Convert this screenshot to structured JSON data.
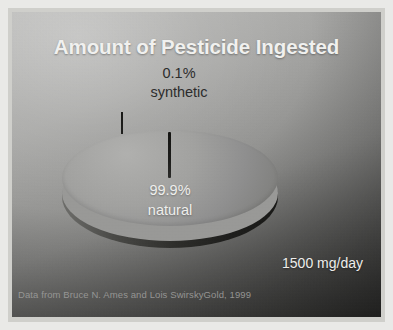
{
  "slide": {
    "title": "Amount of Pesticide Ingested",
    "dose_annotation": "1500 mg/day",
    "source_credit": "Data from Bruce N. Ames and Lois SwirskyGold, 1999"
  },
  "labels": {
    "synthetic_value": "0.1%",
    "synthetic_name": "synthetic",
    "natural_value": "99.9%",
    "natural_name": "natural"
  },
  "colors": {
    "title_text": "#f4f4f2",
    "natural_slice": "#a3a3a1",
    "synthetic_slice": "#1b1b19",
    "side_wall": "#2c2c29",
    "callout_text": "#2b2b2b",
    "inslice_text": "#f2f2f0",
    "credit_text": "#9d9d9b"
  },
  "chart_data": {
    "type": "pie",
    "title": "Amount of Pesticide Ingested",
    "categories": [
      "natural",
      "synthetic"
    ],
    "values": [
      99.9,
      0.1
    ],
    "value_labels": [
      "99.9%",
      "0.1%"
    ],
    "units": "percent of total pesticide ingested",
    "total_annotation": "1500 mg/day",
    "total_value": 1500,
    "total_units": "mg/day",
    "series": [
      {
        "name": "Pesticide ingested",
        "values": [
          99.9,
          0.1
        ],
        "colors": [
          "#a3a3a1",
          "#1b1b19"
        ]
      }
    ],
    "annotations": [
      "0.1% synthetic",
      "99.9% natural",
      "1500 mg/day",
      "Data from Bruce N. Ames and Lois SwirskyGold, 1999"
    ],
    "legend": "none",
    "grid": false,
    "three_d": true,
    "start_angle": 90,
    "xlabel": "",
    "ylabel": ""
  }
}
